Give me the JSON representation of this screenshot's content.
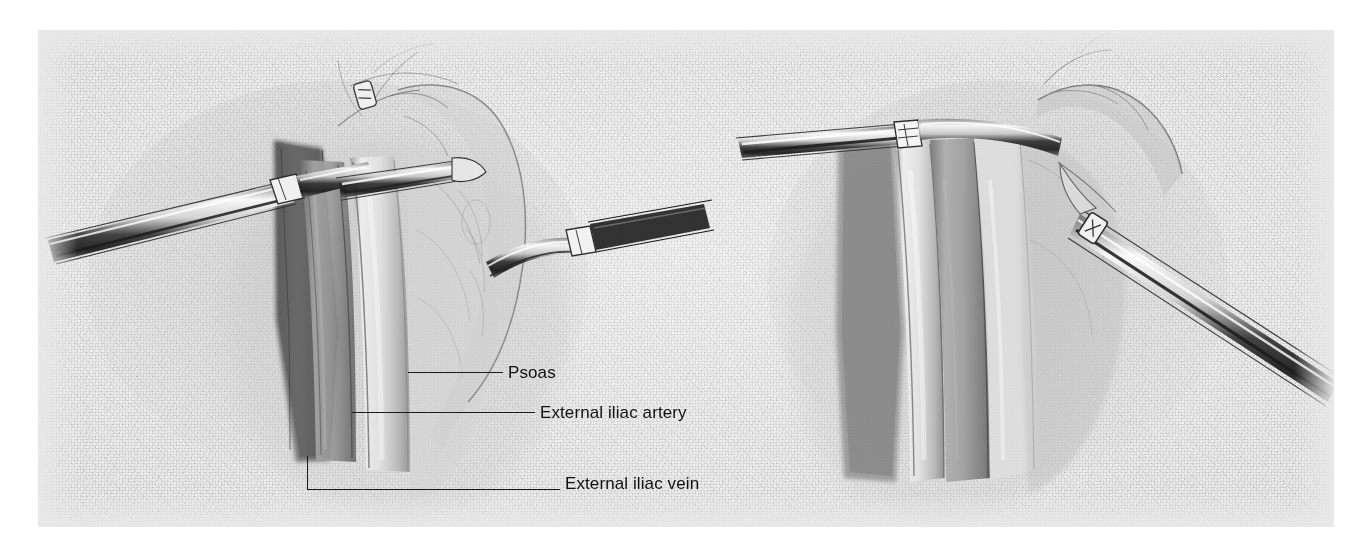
{
  "figure": {
    "kind": "surgical-anatomy-illustration",
    "medium": "graphite pencil rendering",
    "panel_count": 2,
    "background_color": "#e8e8e8",
    "ink_color": "#1a1a1a",
    "text_color": "#111111"
  },
  "panels": [
    {
      "id": "left-panel",
      "name": "Exposure of external iliac vessels with retractors",
      "position": "left"
    },
    {
      "id": "right-panel",
      "name": "Retracted vessels with clamp applied",
      "position": "right"
    }
  ],
  "annotations": [
    {
      "id": "psoas",
      "text": "Psoas",
      "leader_type": "straight",
      "text_x": 508,
      "text_y": 371,
      "line_x1": 408,
      "line_x2": 503,
      "line_y": 372
    },
    {
      "id": "external-iliac-artery",
      "text": "External iliac artery",
      "leader_type": "straight",
      "text_x": 540,
      "text_y": 411,
      "line_x1": 352,
      "line_x2": 535,
      "line_y": 412
    },
    {
      "id": "external-iliac-vein",
      "text": "External iliac vein",
      "leader_type": "elbow",
      "text_x": 565,
      "text_y": 482,
      "line_x1": 307,
      "line_x2": 560,
      "line_y": 489,
      "elbow_y_top": 456
    }
  ],
  "instruments": [
    {
      "id": "left-retractor-lower",
      "name": "retractor-blade",
      "panel": "left-panel"
    },
    {
      "id": "left-retractor-upper",
      "name": "retractor-blade",
      "panel": "left-panel"
    },
    {
      "id": "left-retractor-right",
      "name": "retractor-blade",
      "panel": "left-panel"
    },
    {
      "id": "right-retractor-upper",
      "name": "retractor-blade",
      "panel": "right-panel"
    },
    {
      "id": "right-retractor-lower",
      "name": "retractor-blade",
      "panel": "right-panel"
    }
  ]
}
